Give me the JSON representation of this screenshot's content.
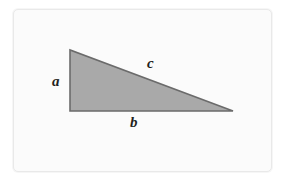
{
  "figure": {
    "name": "right-triangle-sides-labeled",
    "type": "geometry-diagram",
    "background_color": "#ffffff",
    "card": {
      "fill": "#fbfbfb",
      "border_color": "#e9e9e9"
    }
  },
  "shape": {
    "kind": "right-triangle",
    "fill_color": "#a9a9a9",
    "stroke_color": "#6b6b6b",
    "vertices": {
      "top_left": {
        "x": 70,
        "y": 50
      },
      "bottom_left": {
        "x": 70,
        "y": 111
      },
      "right": {
        "x": 233,
        "y": 111
      }
    },
    "right_angle_at": "bottom_left"
  },
  "labels": {
    "leg_vertical": "a",
    "hypotenuse": "c",
    "leg_horizontal": "b"
  }
}
